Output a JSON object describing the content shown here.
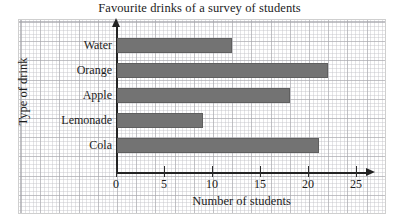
{
  "chart_data": {
    "type": "bar",
    "orientation": "horizontal",
    "title": "Favourite drinks of a survey of students",
    "xlabel": "Number of students",
    "ylabel": "Type of drink",
    "categories": [
      "Cola",
      "Lemonade",
      "Apple",
      "Orange",
      "Water"
    ],
    "values": [
      21,
      9,
      18,
      22,
      12
    ],
    "xlim": [
      0,
      26
    ],
    "xticks": [
      0,
      5,
      10,
      15,
      20,
      25
    ],
    "xtick_labels": [
      "0",
      "5",
      "10",
      "15",
      "20",
      "25"
    ],
    "grid": true,
    "grid_style": "graph-paper",
    "legend": "none",
    "bar_color": "#737373",
    "bar_edge_color": "#5f5f5f",
    "axis_color": "#232323",
    "grid_major_color": "#a5a5aa",
    "grid_minor_color": "#c3c3c8",
    "bars": [
      {
        "label": "Water",
        "value": 12,
        "row": 0
      },
      {
        "label": "Orange",
        "value": 22,
        "row": 1
      },
      {
        "label": "Apple",
        "value": 18,
        "row": 2
      },
      {
        "label": "Lemonade",
        "value": 9,
        "row": 3
      },
      {
        "label": "Cola",
        "value": 21,
        "row": 4
      }
    ]
  }
}
